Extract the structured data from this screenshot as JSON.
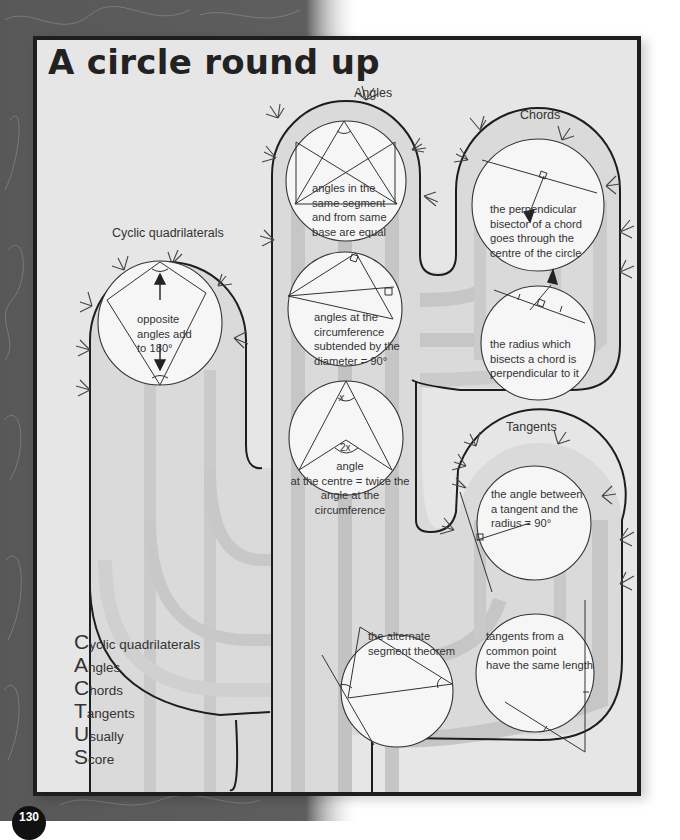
{
  "page": {
    "title": "A circle round up",
    "page_number": "130"
  },
  "sections": {
    "cyclic": {
      "label": "Cyclic quadrilaterals",
      "facts": [
        "opposite",
        "angles add",
        "to 180°"
      ]
    },
    "angles": {
      "label": "Angles",
      "facts": [
        {
          "lines": [
            "angles in the",
            "same segment",
            "and from same",
            "base are equal"
          ]
        },
        {
          "lines": [
            "angles at the",
            "circumference",
            "subtended by the",
            "diameter = 90°"
          ]
        },
        {
          "lines": [
            "angle",
            "at the centre = twice the",
            "angle at the circumference"
          ],
          "marks": [
            "x",
            "2x"
          ]
        }
      ]
    },
    "chords": {
      "label": "Chords",
      "facts": [
        {
          "lines": [
            "the perpendicular",
            "bisector of a chord",
            "goes through the",
            "centre of the circle"
          ]
        },
        {
          "lines": [
            "the radius which",
            "bisects a chord is",
            "perpendicular to it"
          ]
        }
      ]
    },
    "tangents": {
      "label": "Tangents",
      "facts": [
        {
          "lines": [
            "the angle between",
            "a tangent and the",
            "radius = 90°"
          ]
        },
        {
          "lines": [
            "tangents from a",
            "common point",
            "have the same length"
          ]
        },
        {
          "lines": [
            "the alternate",
            "segment theorem"
          ]
        }
      ]
    }
  },
  "mnemonic": [
    {
      "cap": "C",
      "rest": "yclic quadrilaterals"
    },
    {
      "cap": "A",
      "rest": "ngles"
    },
    {
      "cap": "C",
      "rest": "hords"
    },
    {
      "cap": "T",
      "rest": "angents"
    },
    {
      "cap": "U",
      "rest": "sually"
    },
    {
      "cap": "S",
      "rest": "core"
    }
  ],
  "colors": {
    "panel_bg": "#e6e6e6",
    "frame_border": "#1e1e1e",
    "texture_bg": "#5a5a5a",
    "cactus_fill": "#dcdcdc",
    "cactus_stripe": "#c4c4c4",
    "circle_fill": "#f7f7f7",
    "ink": "#222222"
  }
}
